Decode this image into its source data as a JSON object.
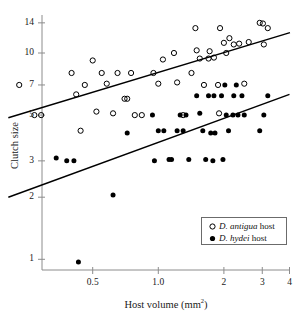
{
  "figure": {
    "kind": "scatter-plot-with-regression-lines",
    "background": "#ffffff",
    "axis_color": "#8c8c8c",
    "line_color": "#000000",
    "text_color": "#1a1a1a"
  },
  "axes": {
    "x_title_main": "Host volume (mm",
    "x_title_sup": "2",
    "x_title_close": ")",
    "y_title": "Clutch size"
  },
  "legend": {
    "position": "bottom-right",
    "border_color": "#6b6b6b",
    "entries": [
      {
        "marker": "open-circle",
        "species": "D. antigua",
        "suffix": " host"
      },
      {
        "marker": "filled-circle",
        "species": "D. hydei",
        "suffix": " host"
      }
    ]
  },
  "chart_data": {
    "type": "scatter",
    "title": "",
    "xlabel": "Host volume (mm2)",
    "ylabel": "Clutch size",
    "xscale": "log",
    "yscale": "log",
    "xlim": [
      0.2,
      4.0
    ],
    "ylim": [
      0.9,
      15.5
    ],
    "grid": false,
    "legend_position": "lower right",
    "xticks": [
      0.5,
      1.0,
      2,
      3,
      4
    ],
    "xticklabels": [
      "0.5",
      "1.0",
      "2",
      "3",
      "4"
    ],
    "yticks": [
      1,
      2,
      3,
      5,
      7,
      10,
      14
    ],
    "yticklabels": [
      "1",
      "2",
      "3",
      "5",
      "7",
      "10",
      "14"
    ],
    "series": [
      {
        "name": "D. antigua host",
        "marker": "open-circle",
        "points": [
          [
            0.23,
            7.0
          ],
          [
            0.27,
            5.0
          ],
          [
            0.29,
            5.0
          ],
          [
            0.4,
            8.0
          ],
          [
            0.42,
            6.3
          ],
          [
            0.44,
            4.2
          ],
          [
            0.46,
            7.0
          ],
          [
            0.5,
            9.2
          ],
          [
            0.52,
            5.2
          ],
          [
            0.55,
            8.0
          ],
          [
            0.58,
            7.1
          ],
          [
            0.62,
            5.1
          ],
          [
            0.65,
            8.0
          ],
          [
            0.7,
            6.0
          ],
          [
            0.72,
            6.0
          ],
          [
            0.75,
            8.0
          ],
          [
            0.78,
            5.0
          ],
          [
            0.84,
            5.0
          ],
          [
            0.95,
            8.0
          ],
          [
            1.0,
            7.1
          ],
          [
            1.05,
            9.3
          ],
          [
            1.18,
            10.0
          ],
          [
            1.22,
            7.2
          ],
          [
            1.3,
            5.0
          ],
          [
            1.42,
            8.0
          ],
          [
            1.48,
            13.2
          ],
          [
            1.5,
            10.3
          ],
          [
            1.55,
            9.4
          ],
          [
            1.62,
            7.0
          ],
          [
            1.7,
            9.4
          ],
          [
            1.72,
            10.2
          ],
          [
            1.8,
            9.5
          ],
          [
            1.88,
            7.0
          ],
          [
            1.9,
            5.1
          ],
          [
            1.92,
            13.2
          ],
          [
            2.0,
            11.2
          ],
          [
            2.05,
            10.0
          ],
          [
            2.12,
            11.8
          ],
          [
            2.22,
            11.0
          ],
          [
            2.35,
            11.1
          ],
          [
            2.48,
            7.1
          ],
          [
            2.6,
            11.3
          ],
          [
            2.92,
            14.0
          ],
          [
            3.02,
            13.9
          ],
          [
            3.05,
            11.0
          ],
          [
            3.18,
            13.2
          ]
        ]
      },
      {
        "name": "D. hydei host",
        "marker": "filled-circle",
        "points": [
          [
            0.34,
            3.1
          ],
          [
            0.38,
            3.0
          ],
          [
            0.41,
            3.0
          ],
          [
            0.43,
            0.97
          ],
          [
            0.62,
            2.05
          ],
          [
            0.72,
            4.1
          ],
          [
            0.94,
            5.0
          ],
          [
            0.96,
            3.0
          ],
          [
            1.0,
            4.2
          ],
          [
            1.06,
            4.2
          ],
          [
            1.12,
            3.05
          ],
          [
            1.15,
            3.05
          ],
          [
            1.22,
            4.2
          ],
          [
            1.26,
            5.0
          ],
          [
            1.3,
            4.2
          ],
          [
            1.34,
            5.0
          ],
          [
            1.38,
            3.05
          ],
          [
            1.5,
            6.2
          ],
          [
            1.55,
            5.1
          ],
          [
            1.6,
            4.2
          ],
          [
            1.65,
            3.05
          ],
          [
            1.7,
            6.2
          ],
          [
            1.74,
            4.1
          ],
          [
            1.78,
            3.0
          ],
          [
            1.8,
            6.2
          ],
          [
            1.82,
            4.1
          ],
          [
            1.95,
            6.2
          ],
          [
            1.98,
            3.05
          ],
          [
            2.02,
            7.0
          ],
          [
            2.05,
            5.0
          ],
          [
            2.1,
            4.2
          ],
          [
            2.2,
            5.0
          ],
          [
            2.22,
            6.2
          ],
          [
            2.28,
            7.0
          ],
          [
            2.32,
            5.0
          ],
          [
            2.42,
            6.2
          ],
          [
            2.48,
            5.0
          ],
          [
            2.92,
            4.2
          ],
          [
            3.05,
            5.0
          ],
          [
            3.18,
            6.2
          ]
        ]
      }
    ],
    "regression_lines": [
      {
        "name": "D. antigua fit",
        "x": [
          0.205,
          4.02
        ],
        "y": [
          4.85,
          12.55
        ]
      },
      {
        "name": "D. hydei fit",
        "x": [
          0.205,
          4.0
        ],
        "y": [
          2.0,
          6.3
        ]
      }
    ]
  }
}
